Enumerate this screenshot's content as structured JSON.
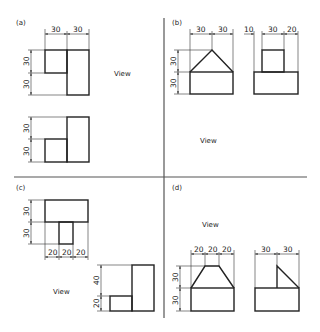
{
  "figure": {
    "panels": [
      {
        "id": "a",
        "label": "(a)",
        "view_label": "View",
        "top_dims": [
          "30",
          "30"
        ],
        "view1_left_dims": [
          "30",
          "30"
        ],
        "view2_left_dims": [
          "30",
          "30"
        ]
      },
      {
        "id": "b",
        "label": "(b)",
        "view_label": "View",
        "front_top_dims": [
          "30",
          "30"
        ],
        "front_left_dims": [
          "30",
          "30"
        ],
        "side_top_dims": [
          "10",
          "30",
          "20"
        ]
      },
      {
        "id": "c",
        "label": "(c)",
        "view_label": "View",
        "view1_left_dims": [
          "30",
          "30"
        ],
        "view1_bottom_dims": [
          "20",
          "20",
          "20"
        ],
        "view2_left_dims": [
          "40",
          "20"
        ]
      },
      {
        "id": "d",
        "label": "(d)",
        "view_label": "View",
        "front_top_dims": [
          "20",
          "20",
          "20"
        ],
        "front_left_dims": [
          "30",
          "30"
        ],
        "side_top_dims": [
          "30",
          "30"
        ]
      }
    ]
  },
  "colors": {
    "line": "#222222",
    "divider": "#555555",
    "background": "#ffffff"
  }
}
